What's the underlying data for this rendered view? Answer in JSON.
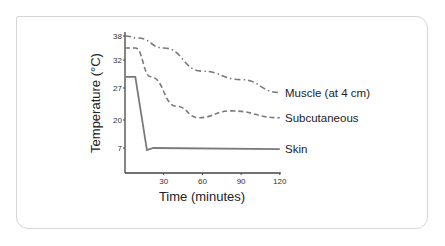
{
  "chart_data": {
    "type": "line",
    "title": "",
    "xlabel": "Time (minutes)",
    "ylabel": "Temperature (°C)",
    "xlim": [
      0,
      120
    ],
    "x_ticks": [
      30,
      60,
      90,
      120
    ],
    "y_ticks": [
      38,
      32,
      27,
      20,
      7
    ],
    "grid": false,
    "legend_position": "inline-right",
    "series": [
      {
        "name": "Muscle (at 4 cm)",
        "style": "dash-dot",
        "x": [
          0,
          10,
          30,
          60,
          90,
          120
        ],
        "values": [
          38,
          37.5,
          35,
          30,
          28.5,
          26
        ]
      },
      {
        "name": "Subcutaneous",
        "style": "dashed",
        "x": [
          0,
          8,
          20,
          40,
          57,
          82,
          120
        ],
        "values": [
          35,
          35,
          29,
          23,
          20.5,
          22,
          20.5
        ]
      },
      {
        "name": "Skin",
        "style": "solid",
        "x": [
          0,
          8,
          17,
          22,
          120
        ],
        "values": [
          29,
          29,
          6,
          7,
          6.5
        ]
      }
    ]
  },
  "colors": {
    "line": "#7a7a7a",
    "axis": "#444444",
    "text": "#222222",
    "card_border": "#d6d6d6"
  }
}
